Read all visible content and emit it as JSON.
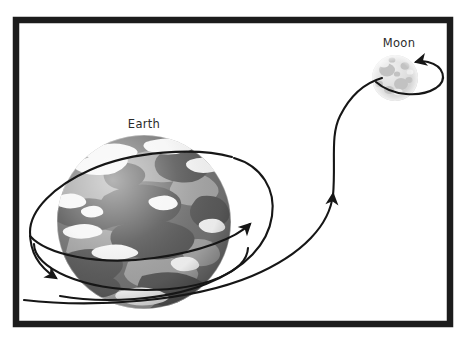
{
  "diagram": {
    "frame": {
      "name": "outer-frame",
      "x": 13,
      "y": 17,
      "width": 440,
      "height": 310,
      "stroke_color": "#1c1c1c",
      "stroke_width": 6,
      "fill_color": "#ffffff"
    },
    "background_color": "#ffffff",
    "bodies": [
      {
        "id": "earth",
        "label": "Earth",
        "label_x": 144,
        "label_y": 128,
        "cx": 144,
        "cy": 222,
        "r": 87,
        "ocean_color": "#6e6e6e",
        "land_color": "#a2a2a2",
        "cloud_color": "#f4f4f4",
        "shadow_color": "#4f4f4f"
      },
      {
        "id": "moon",
        "label": "Moon",
        "label_x": 399,
        "label_y": 47,
        "cx": 395,
        "cy": 78,
        "r": 23,
        "surface_color": "#d4d4d4",
        "crater_color": "#bfbfbf",
        "highlight_color": "#ececec"
      }
    ],
    "paths": [
      {
        "id": "earth-orbit",
        "name": "earth-rotation-orbit",
        "stroke_color": "#161616",
        "stroke_width": 2.1,
        "arrowheads": 2,
        "description": "Elliptical spiral orbit around the Earth"
      },
      {
        "id": "transfer-path",
        "name": "earth-to-moon-transfer-path",
        "stroke_color": "#161616",
        "stroke_width": 2.1,
        "arrowheads": 1,
        "description": "Curved trajectory from Earth orbit up to the Moon"
      },
      {
        "id": "moon-orbit",
        "name": "moon-orbit-loop",
        "stroke_color": "#161616",
        "stroke_width": 2.1,
        "arrowheads": 1,
        "description": "Small loop around the Moon"
      }
    ]
  }
}
